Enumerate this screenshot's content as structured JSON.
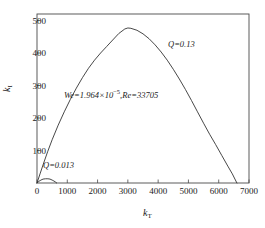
{
  "chart_data": {
    "type": "line",
    "title": "",
    "xlabel": "k_T",
    "ylabel": "k_I",
    "xlim": [
      0,
      7000
    ],
    "ylim": [
      0,
      520
    ],
    "grid": false,
    "legend": "none",
    "xticks": [
      0,
      1000,
      2000,
      3000,
      4000,
      5000,
      6000,
      7000
    ],
    "xtick_labels": [
      "0",
      "1000",
      "2000",
      "3000",
      "4000",
      "5000",
      "6000",
      "7000"
    ],
    "yticks": [
      0,
      100,
      200,
      300,
      400,
      500
    ],
    "ytick_labels": [
      "",
      "100",
      "200",
      "300",
      "400",
      "500"
    ],
    "series": [
      {
        "name": "Q=0.13",
        "color": "#333333",
        "x": [
          0,
          100,
          200,
          350,
          500,
          700,
          900,
          1100,
          1300,
          1500,
          1700,
          1900,
          2100,
          2300,
          2500,
          2700,
          2900,
          3000,
          3100,
          3300,
          3500,
          3700,
          3900,
          4100,
          4300,
          4500,
          4700,
          4900,
          5100,
          5300,
          5500,
          5700,
          5900,
          6100,
          6300,
          6450,
          6600
        ],
        "y": [
          0,
          28,
          56,
          96,
          133,
          178,
          219,
          257,
          292,
          324,
          353,
          378,
          400,
          420,
          440,
          460,
          474,
          477,
          476,
          470,
          459,
          444,
          425,
          403,
          378,
          350,
          320,
          288,
          254,
          219,
          184,
          150,
          118,
          85,
          52,
          28,
          0
        ]
      },
      {
        "name": "Q=0.013",
        "color": "#333333",
        "x": [
          0,
          60,
          130,
          200,
          280,
          360,
          430,
          500,
          560,
          610,
          650
        ],
        "y": [
          0,
          5,
          9,
          12,
          13,
          13,
          12,
          9,
          6,
          3,
          0
        ]
      }
    ],
    "annotations": [
      {
        "id": "params",
        "text_prefix": "We=1.964×10",
        "text_exponent": "−5",
        "text_suffix": ",Re=33705",
        "x": 1700,
        "y": 250
      },
      {
        "id": "q-high",
        "text": "Q=0.13",
        "x": 4900,
        "y": 415
      },
      {
        "id": "q-low",
        "text": "Q=0.013",
        "x": 350,
        "y": 60
      }
    ]
  },
  "axis": {
    "x_title_symbol": "k",
    "x_title_sub": "T",
    "y_title_symbol": "k",
    "y_title_sub": "I"
  },
  "colors": {
    "frame": "#4a4a4a",
    "curve": "#333333",
    "text": "#1a1a1a",
    "background": "#ffffff"
  }
}
